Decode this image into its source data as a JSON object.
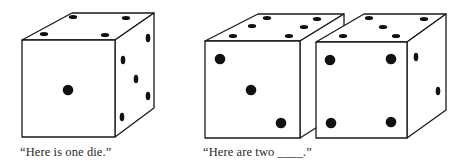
{
  "figure": {
    "panels": [
      {
        "id": "one-die",
        "caption": "“Here is one die.”",
        "dice": [
          {
            "name": "single-die",
            "front_face_value": 1,
            "top_face_value": 4,
            "side_face_value": 5
          }
        ]
      },
      {
        "id": "two-dice",
        "caption": "“Here are two ____.”",
        "dice": [
          {
            "name": "left-die",
            "front_face_value": 3,
            "top_face_value": 6,
            "side_face_value": null
          },
          {
            "name": "right-die",
            "front_face_value": 4,
            "top_face_value": 5,
            "side_face_value": 2
          }
        ]
      }
    ],
    "colors": {
      "background": "#ffffff",
      "outline": "#1a1a1a",
      "pip": "#111111",
      "text": "#2a2a2a"
    }
  }
}
